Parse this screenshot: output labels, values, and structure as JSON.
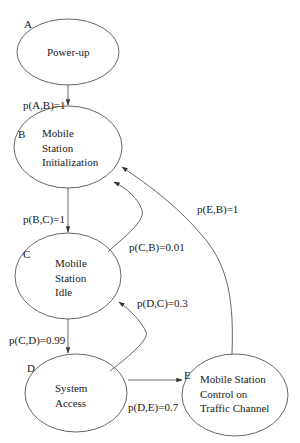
{
  "diagram": {
    "type": "state-transition",
    "colors": {
      "stroke": "#555555",
      "text": "#1a1a1a",
      "background": "#ffffff"
    },
    "states": [
      {
        "id": "A",
        "letter": "A",
        "lines": [
          "Power-up"
        ]
      },
      {
        "id": "B",
        "letter": "B",
        "lines": [
          "Mobile",
          "Station",
          "Initialization"
        ]
      },
      {
        "id": "C",
        "letter": "C",
        "lines": [
          "Mobile",
          "Station",
          "Idle"
        ]
      },
      {
        "id": "D",
        "letter": "D",
        "lines": [
          "System",
          "Access"
        ]
      },
      {
        "id": "E",
        "letter": "E",
        "lines": [
          "Mobile Station",
          "Control on",
          "Traffic Channel"
        ]
      }
    ],
    "transitions": [
      {
        "from": "A",
        "to": "B",
        "label": "p(A,B)=1"
      },
      {
        "from": "B",
        "to": "C",
        "label": "p(B,C)=1"
      },
      {
        "from": "C",
        "to": "B",
        "label": "p(C,B)=0.01"
      },
      {
        "from": "C",
        "to": "D",
        "label": "p(C,D)=0.99"
      },
      {
        "from": "D",
        "to": "C",
        "label": "p(D,C)=0.3"
      },
      {
        "from": "D",
        "to": "E",
        "label": "p(D,E)=0.7"
      },
      {
        "from": "E",
        "to": "B",
        "label": "p(E,B)=1"
      }
    ]
  }
}
